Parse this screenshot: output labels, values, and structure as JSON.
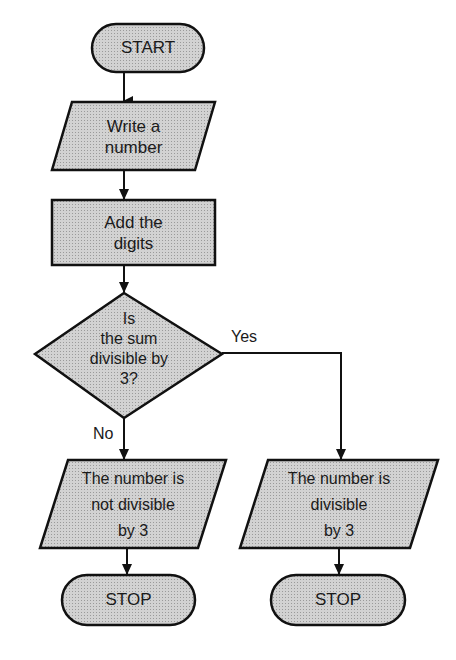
{
  "colors": {
    "fill": "#c9c9c9",
    "stroke": "#111111",
    "background": "#ffffff"
  },
  "nodes": {
    "start": {
      "type": "terminal",
      "text": "START"
    },
    "input": {
      "type": "input-output",
      "text": "Write a\nnumber"
    },
    "process": {
      "type": "process",
      "text": "Add the\ndigits"
    },
    "decision": {
      "type": "decision",
      "text": "Is\nthe sum\ndivisible by\n3?"
    },
    "out_no": {
      "type": "input-output",
      "text": "The number is\nnot divisible\nby 3"
    },
    "out_yes": {
      "type": "input-output",
      "text": "The number is\ndivisible\nby 3"
    },
    "stop_left": {
      "type": "terminal",
      "text": "STOP"
    },
    "stop_right": {
      "type": "terminal",
      "text": "STOP"
    }
  },
  "edges": {
    "yes_label": "Yes",
    "no_label": "No"
  }
}
